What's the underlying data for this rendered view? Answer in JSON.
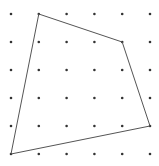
{
  "diagram": {
    "type": "dot-grid-polygon",
    "grid": {
      "columns": 6,
      "rows": 6
    },
    "polygon_vertices_grid": [
      [
        1,
        0
      ],
      [
        4,
        1
      ],
      [
        5,
        4
      ],
      [
        0,
        5
      ]
    ],
    "colors": {
      "dot": "#333333",
      "edge": "#555555",
      "background": "#ffffff"
    }
  }
}
